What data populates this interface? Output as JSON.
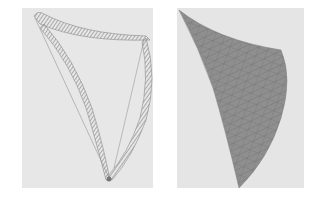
{
  "figure": {
    "panels": [
      {
        "id": "left",
        "description": "Wireframe sketch of curved edge boundaries with hatched coil-like strips",
        "colors": {
          "background": "#e7e7e7",
          "stroke": "#8a8a8a",
          "hatch": "#9a9a9a"
        }
      },
      {
        "id": "right",
        "description": "Curved surface patch rendered with triangular mesh",
        "colors": {
          "background": "#e5e5e5",
          "fill": "#8e8e8e",
          "mesh": "#6f6f6f"
        }
      }
    ]
  }
}
